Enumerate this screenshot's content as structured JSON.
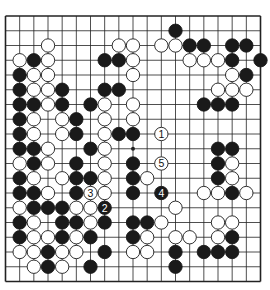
{
  "board": {
    "size": 19,
    "line_color": "#222222",
    "black_color": "#1a1a1a",
    "white_color": "#ffffff",
    "star_points": [
      [
        9,
        9
      ]
    ],
    "stones": [
      {
        "row": 1,
        "col": 12,
        "color": "black"
      },
      {
        "row": 2,
        "col": 3,
        "color": "white"
      },
      {
        "row": 2,
        "col": 8,
        "color": "white"
      },
      {
        "row": 2,
        "col": 9,
        "color": "white"
      },
      {
        "row": 2,
        "col": 11,
        "color": "white"
      },
      {
        "row": 2,
        "col": 12,
        "color": "white"
      },
      {
        "row": 2,
        "col": 13,
        "color": "black"
      },
      {
        "row": 2,
        "col": 14,
        "color": "black"
      },
      {
        "row": 2,
        "col": 16,
        "color": "black"
      },
      {
        "row": 2,
        "col": 17,
        "color": "black"
      },
      {
        "row": 3,
        "col": 1,
        "color": "white"
      },
      {
        "row": 3,
        "col": 2,
        "color": "black"
      },
      {
        "row": 3,
        "col": 3,
        "color": "white"
      },
      {
        "row": 3,
        "col": 7,
        "color": "black"
      },
      {
        "row": 3,
        "col": 8,
        "color": "black"
      },
      {
        "row": 3,
        "col": 9,
        "color": "white"
      },
      {
        "row": 3,
        "col": 13,
        "color": "white"
      },
      {
        "row": 3,
        "col": 14,
        "color": "white"
      },
      {
        "row": 3,
        "col": 15,
        "color": "white"
      },
      {
        "row": 3,
        "col": 16,
        "color": "black"
      },
      {
        "row": 3,
        "col": 18,
        "color": "black"
      },
      {
        "row": 4,
        "col": 1,
        "color": "black"
      },
      {
        "row": 4,
        "col": 2,
        "color": "white"
      },
      {
        "row": 4,
        "col": 3,
        "color": "white"
      },
      {
        "row": 4,
        "col": 9,
        "color": "white"
      },
      {
        "row": 4,
        "col": 16,
        "color": "white"
      },
      {
        "row": 4,
        "col": 17,
        "color": "black"
      },
      {
        "row": 5,
        "col": 1,
        "color": "black"
      },
      {
        "row": 5,
        "col": 2,
        "color": "white"
      },
      {
        "row": 5,
        "col": 3,
        "color": "white"
      },
      {
        "row": 5,
        "col": 4,
        "color": "black"
      },
      {
        "row": 5,
        "col": 7,
        "color": "black"
      },
      {
        "row": 5,
        "col": 8,
        "color": "black"
      },
      {
        "row": 5,
        "col": 15,
        "color": "white"
      },
      {
        "row": 5,
        "col": 16,
        "color": "white"
      },
      {
        "row": 5,
        "col": 17,
        "color": "white"
      },
      {
        "row": 6,
        "col": 1,
        "color": "black"
      },
      {
        "row": 6,
        "col": 2,
        "color": "black"
      },
      {
        "row": 6,
        "col": 3,
        "color": "white"
      },
      {
        "row": 6,
        "col": 4,
        "color": "black"
      },
      {
        "row": 6,
        "col": 6,
        "color": "black"
      },
      {
        "row": 6,
        "col": 7,
        "color": "white"
      },
      {
        "row": 6,
        "col": 9,
        "color": "white"
      },
      {
        "row": 6,
        "col": 14,
        "color": "black"
      },
      {
        "row": 6,
        "col": 15,
        "color": "black"
      },
      {
        "row": 6,
        "col": 16,
        "color": "black"
      },
      {
        "row": 7,
        "col": 1,
        "color": "black"
      },
      {
        "row": 7,
        "col": 2,
        "color": "white"
      },
      {
        "row": 7,
        "col": 4,
        "color": "white"
      },
      {
        "row": 7,
        "col": 5,
        "color": "black"
      },
      {
        "row": 7,
        "col": 7,
        "color": "white"
      },
      {
        "row": 7,
        "col": 9,
        "color": "white"
      },
      {
        "row": 8,
        "col": 1,
        "color": "black"
      },
      {
        "row": 8,
        "col": 2,
        "color": "white"
      },
      {
        "row": 8,
        "col": 4,
        "color": "white"
      },
      {
        "row": 8,
        "col": 5,
        "color": "black"
      },
      {
        "row": 8,
        "col": 7,
        "color": "white"
      },
      {
        "row": 8,
        "col": 8,
        "color": "black"
      },
      {
        "row": 8,
        "col": 9,
        "color": "black"
      },
      {
        "row": 8,
        "col": 11,
        "color": "white",
        "label": "1"
      },
      {
        "row": 9,
        "col": 1,
        "color": "black"
      },
      {
        "row": 9,
        "col": 2,
        "color": "black"
      },
      {
        "row": 9,
        "col": 3,
        "color": "white"
      },
      {
        "row": 9,
        "col": 6,
        "color": "black"
      },
      {
        "row": 9,
        "col": 7,
        "color": "white"
      },
      {
        "row": 9,
        "col": 15,
        "color": "black"
      },
      {
        "row": 9,
        "col": 16,
        "color": "black"
      },
      {
        "row": 10,
        "col": 1,
        "color": "white"
      },
      {
        "row": 10,
        "col": 2,
        "color": "black"
      },
      {
        "row": 10,
        "col": 3,
        "color": "white"
      },
      {
        "row": 10,
        "col": 5,
        "color": "black"
      },
      {
        "row": 10,
        "col": 7,
        "color": "white"
      },
      {
        "row": 10,
        "col": 9,
        "color": "black"
      },
      {
        "row": 10,
        "col": 11,
        "color": "white",
        "label": "5"
      },
      {
        "row": 10,
        "col": 15,
        "color": "black"
      },
      {
        "row": 10,
        "col": 16,
        "color": "white"
      },
      {
        "row": 11,
        "col": 1,
        "color": "black"
      },
      {
        "row": 11,
        "col": 2,
        "color": "white"
      },
      {
        "row": 11,
        "col": 4,
        "color": "white"
      },
      {
        "row": 11,
        "col": 5,
        "color": "black"
      },
      {
        "row": 11,
        "col": 6,
        "color": "black"
      },
      {
        "row": 11,
        "col": 7,
        "color": "white"
      },
      {
        "row": 11,
        "col": 9,
        "color": "black"
      },
      {
        "row": 11,
        "col": 10,
        "color": "white"
      },
      {
        "row": 11,
        "col": 15,
        "color": "black"
      },
      {
        "row": 11,
        "col": 16,
        "color": "white"
      },
      {
        "row": 12,
        "col": 1,
        "color": "black"
      },
      {
        "row": 12,
        "col": 2,
        "color": "black"
      },
      {
        "row": 12,
        "col": 3,
        "color": "white"
      },
      {
        "row": 12,
        "col": 5,
        "color": "black"
      },
      {
        "row": 12,
        "col": 6,
        "color": "white",
        "label": "3"
      },
      {
        "row": 12,
        "col": 7,
        "color": "white"
      },
      {
        "row": 12,
        "col": 9,
        "color": "black"
      },
      {
        "row": 12,
        "col": 11,
        "color": "black",
        "label": "4"
      },
      {
        "row": 12,
        "col": 14,
        "color": "white"
      },
      {
        "row": 12,
        "col": 15,
        "color": "white"
      },
      {
        "row": 12,
        "col": 16,
        "color": "black"
      },
      {
        "row": 12,
        "col": 17,
        "color": "white"
      },
      {
        "row": 13,
        "col": 1,
        "color": "white"
      },
      {
        "row": 13,
        "col": 2,
        "color": "black"
      },
      {
        "row": 13,
        "col": 3,
        "color": "black"
      },
      {
        "row": 13,
        "col": 4,
        "color": "black"
      },
      {
        "row": 13,
        "col": 5,
        "color": "white"
      },
      {
        "row": 13,
        "col": 6,
        "color": "white"
      },
      {
        "row": 13,
        "col": 7,
        "color": "black",
        "label": "2"
      },
      {
        "row": 13,
        "col": 12,
        "color": "white"
      },
      {
        "row": 14,
        "col": 1,
        "color": "black"
      },
      {
        "row": 14,
        "col": 2,
        "color": "white"
      },
      {
        "row": 14,
        "col": 4,
        "color": "black"
      },
      {
        "row": 14,
        "col": 5,
        "color": "black"
      },
      {
        "row": 14,
        "col": 6,
        "color": "white"
      },
      {
        "row": 14,
        "col": 7,
        "color": "black"
      },
      {
        "row": 14,
        "col": 9,
        "color": "black"
      },
      {
        "row": 14,
        "col": 10,
        "color": "black"
      },
      {
        "row": 14,
        "col": 11,
        "color": "white"
      },
      {
        "row": 14,
        "col": 15,
        "color": "white"
      },
      {
        "row": 14,
        "col": 16,
        "color": "white"
      },
      {
        "row": 15,
        "col": 1,
        "color": "black"
      },
      {
        "row": 15,
        "col": 2,
        "color": "white"
      },
      {
        "row": 15,
        "col": 3,
        "color": "white"
      },
      {
        "row": 15,
        "col": 4,
        "color": "black"
      },
      {
        "row": 15,
        "col": 5,
        "color": "white"
      },
      {
        "row": 15,
        "col": 6,
        "color": "black"
      },
      {
        "row": 15,
        "col": 9,
        "color": "black"
      },
      {
        "row": 15,
        "col": 10,
        "color": "white"
      },
      {
        "row": 15,
        "col": 12,
        "color": "white"
      },
      {
        "row": 15,
        "col": 13,
        "color": "white"
      },
      {
        "row": 15,
        "col": 15,
        "color": "white"
      },
      {
        "row": 15,
        "col": 16,
        "color": "black"
      },
      {
        "row": 16,
        "col": 1,
        "color": "white"
      },
      {
        "row": 16,
        "col": 2,
        "color": "white"
      },
      {
        "row": 16,
        "col": 3,
        "color": "black"
      },
      {
        "row": 16,
        "col": 4,
        "color": "white"
      },
      {
        "row": 16,
        "col": 5,
        "color": "white"
      },
      {
        "row": 16,
        "col": 7,
        "color": "black"
      },
      {
        "row": 16,
        "col": 9,
        "color": "white"
      },
      {
        "row": 16,
        "col": 10,
        "color": "white"
      },
      {
        "row": 16,
        "col": 12,
        "color": "black"
      },
      {
        "row": 16,
        "col": 14,
        "color": "black"
      },
      {
        "row": 16,
        "col": 15,
        "color": "black"
      },
      {
        "row": 16,
        "col": 16,
        "color": "black"
      },
      {
        "row": 17,
        "col": 2,
        "color": "white"
      },
      {
        "row": 17,
        "col": 3,
        "color": "black"
      },
      {
        "row": 17,
        "col": 4,
        "color": "white"
      },
      {
        "row": 17,
        "col": 6,
        "color": "black"
      },
      {
        "row": 17,
        "col": 12,
        "color": "black"
      }
    ]
  }
}
